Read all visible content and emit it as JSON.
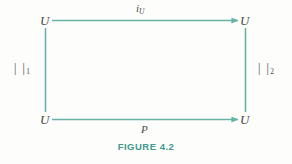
{
  "figure": {
    "caption": "FIGURE 4.2",
    "accent_color": "#67b3a6",
    "caption_color": "#3e9a8c",
    "text_color": "#4a4a4a",
    "background_color": "#fdfdfb",
    "type": "commutative-square-diagram"
  },
  "vertices": {
    "top_left": "U",
    "top_right": "U",
    "bottom_left": "U",
    "bottom_right": "U"
  },
  "edges": {
    "top": {
      "label_base": "i",
      "label_sub": "U",
      "direction": "left-to-right",
      "arrowhead": true
    },
    "bottom": {
      "label_base": "P",
      "label_sub": "",
      "direction": "left-to-right",
      "arrowhead": true
    },
    "left": {
      "label_base": "| |",
      "label_sub": "1",
      "direction": "none",
      "arrowhead": false
    },
    "right": {
      "label_base": "| |",
      "label_sub": "2",
      "direction": "none",
      "arrowhead": false
    }
  }
}
